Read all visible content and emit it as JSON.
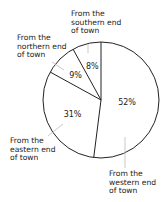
{
  "chart_data": {
    "type": "pie",
    "title": "",
    "categories": [
      "From the western end of town",
      "From the eastern end of town",
      "From the northern end of town",
      "From the southern end of town"
    ],
    "values": [
      52,
      31,
      9,
      8
    ],
    "value_labels": [
      "52%",
      "31%",
      "9%",
      "8%"
    ],
    "start_angle": "top (12 o'clock)",
    "direction": "clockwise",
    "legend": "none (callout labels)"
  },
  "labels": {
    "southern": "From the\nsouthern end\nof town",
    "northern": "From the\nnorthern end\nof town",
    "eastern": "From the\neastern end\nof town",
    "western": "From the\nwestern end\nof town"
  },
  "colors": {
    "fill": "#ffffff",
    "stroke": "#222222",
    "leader": "#bbbbbb"
  }
}
